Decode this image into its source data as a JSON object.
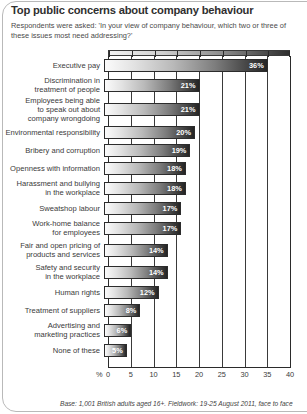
{
  "title": "Top public concerns about company behaviour",
  "subtitle": "Respondents were asked: 'In your view of company behaviour, which two or three of these issues most need addressing?'",
  "footnote": "Base: 1,001 British adults aged 16+. Fieldwork: 19-25 August 2011, face to face",
  "axis": {
    "percent_symbol": "%",
    "ticks": [
      "0",
      "5",
      "10",
      "15",
      "20",
      "25",
      "30",
      "35",
      "40"
    ]
  },
  "chart_data": {
    "type": "bar",
    "orientation": "horizontal",
    "title": "Top public concerns about company behaviour",
    "subtitle": "Respondents were asked: 'In your view of company behaviour, which two or three of these issues most need addressing?'",
    "xlabel": "%",
    "ylabel": "",
    "xlim": [
      0,
      40
    ],
    "xticks": [
      0,
      5,
      10,
      15,
      20,
      25,
      30,
      35,
      40
    ],
    "grid": true,
    "legend": false,
    "value_suffix": "%",
    "categories": [
      "Executive pay",
      "Discrimination in\ntreatment of people",
      "Employees being able\nto speak out about\ncompany wrongdoing",
      "Environmental responsibility",
      "Bribery and corruption",
      "Openness with information",
      "Harassment and bullying\nin the workplace",
      "Sweatshop labour",
      "Work-home balance\nfor employees",
      "Fair and open pricing of\nproducts and services",
      "Safety and security\nin the workplace",
      "Human rights",
      "Treatment of suppliers",
      "Advertising and\nmarketing practices",
      "None of these"
    ],
    "values": [
      36,
      21,
      21,
      20,
      19,
      18,
      18,
      17,
      17,
      14,
      14,
      12,
      8,
      6,
      5
    ],
    "value_labels": [
      "36%",
      "21%",
      "21%",
      "20%",
      "19%",
      "18%",
      "18%",
      "17%",
      "17%",
      "14%",
      "14%",
      "12%",
      "8%",
      "6%",
      "5%"
    ],
    "bar_gradient": [
      "#fbfbfb",
      "#242424"
    ],
    "bar_border_color": "#2c2c2c",
    "value_label_color": "#ffffff",
    "grid_color": "#3a3a3a",
    "text_color": "#3a3a3a",
    "background": "#ffffff"
  }
}
